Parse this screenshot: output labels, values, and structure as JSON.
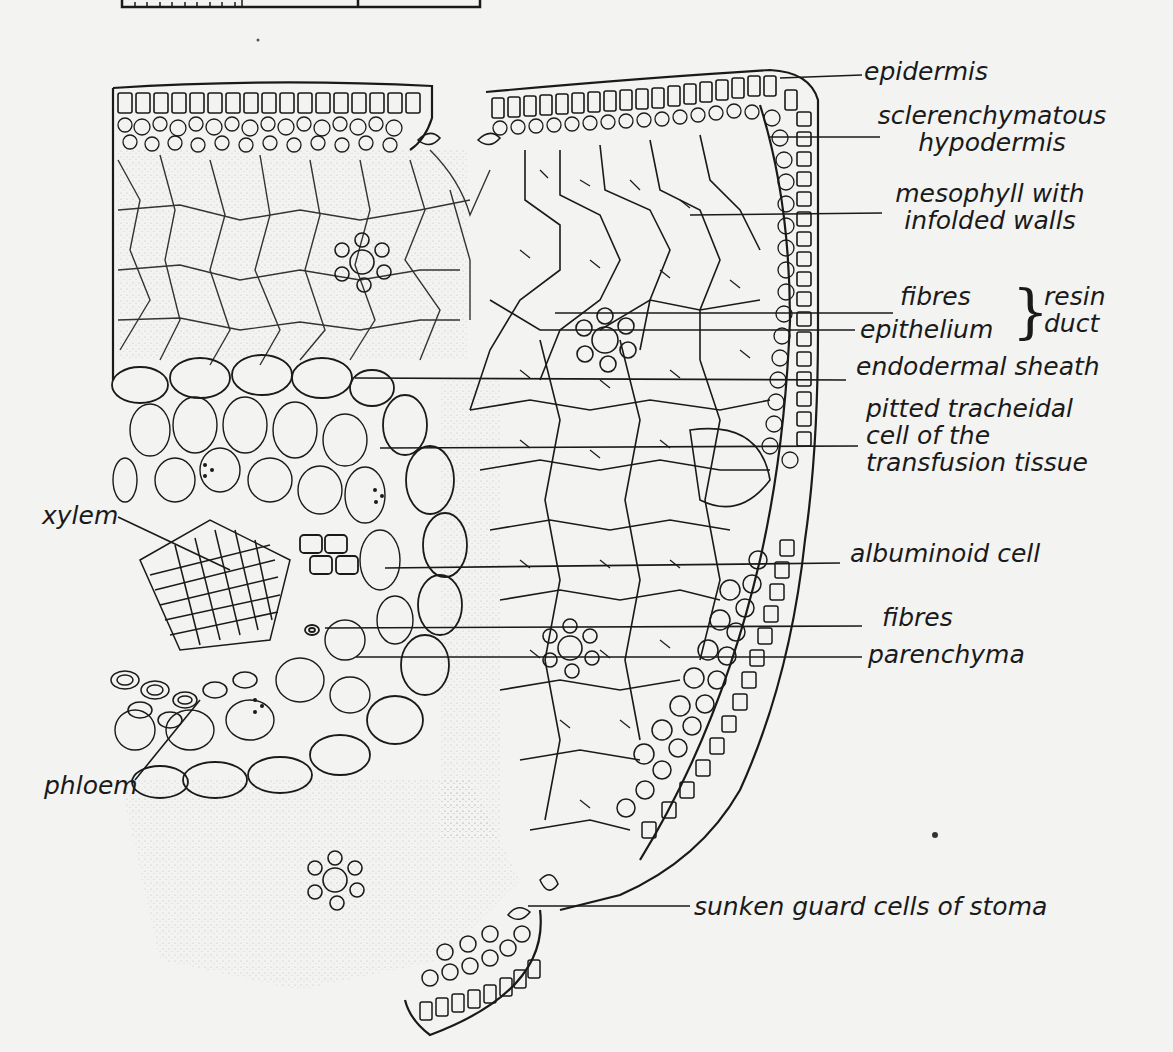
{
  "figure": {
    "colors": {
      "background": "#f3f3f1",
      "ink": "#1a1a1a"
    }
  },
  "labels": {
    "right": [
      {
        "id": "epidermis",
        "lines": [
          "epidermis"
        ]
      },
      {
        "id": "sclerenchymatous-hypodermis",
        "lines": [
          "sclerenchymatous",
          "hypodermis"
        ]
      },
      {
        "id": "mesophyll",
        "lines": [
          "mesophyll with",
          "infolded walls"
        ]
      },
      {
        "id": "resin-duct-fibres",
        "lines": [
          "fibres"
        ]
      },
      {
        "id": "resin-duct-epithelium",
        "lines": [
          "epithelium"
        ]
      },
      {
        "id": "endodermal-sheath",
        "lines": [
          "endodermal sheath"
        ]
      },
      {
        "id": "transfusion-tracheid",
        "lines": [
          "pitted tracheidal",
          "cell of the",
          "transfusion tissue"
        ]
      },
      {
        "id": "albuminoid-cell",
        "lines": [
          "albuminoid cell"
        ]
      },
      {
        "id": "fibres",
        "lines": [
          "fibres"
        ]
      },
      {
        "id": "parenchyma",
        "lines": [
          "parenchyma"
        ]
      },
      {
        "id": "guard-cells",
        "lines": [
          "sunken guard cells of stoma"
        ]
      }
    ],
    "group": {
      "lines": [
        "resin",
        "duct"
      ]
    },
    "left": [
      {
        "id": "xylem",
        "lines": [
          "xylem"
        ]
      },
      {
        "id": "phloem",
        "lines": [
          "phloem"
        ]
      }
    ]
  },
  "scale_bar": {
    "visible": true,
    "minor_ticks": 10
  }
}
